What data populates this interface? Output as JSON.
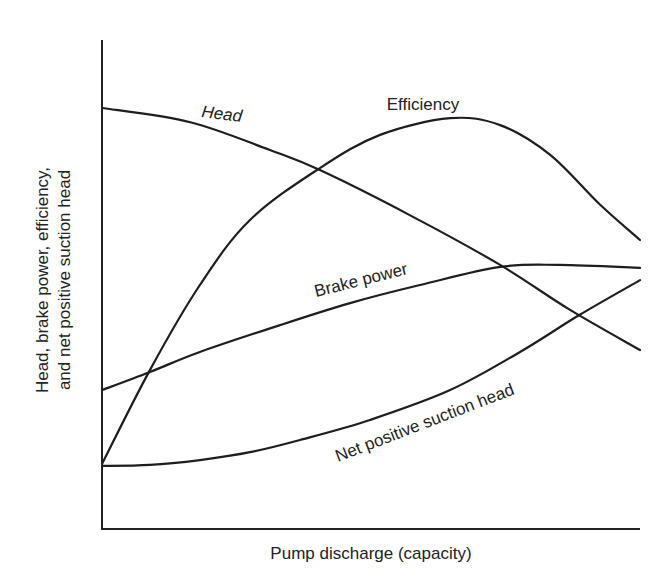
{
  "chart_data": {
    "type": "line",
    "title": "",
    "xlabel": "Pump discharge (capacity)",
    "ylabel_lines": [
      "Head, brake power, efficiency,",
      "and net positive suction head"
    ],
    "xlim": [
      0,
      100
    ],
    "ylim": [
      0,
      100
    ],
    "grid": false,
    "legend": "none (curves labeled inline)",
    "x_ticks": [],
    "y_ticks": [],
    "series": [
      {
        "name": "Head",
        "label": "Head",
        "label_style": "italic",
        "points": [
          [
            0,
            86.1
          ],
          [
            16.4,
            83.2
          ],
          [
            31.2,
            77.5
          ],
          [
            40.5,
            73.4
          ],
          [
            57.2,
            64.2
          ],
          [
            74.0,
            54.0
          ],
          [
            87.0,
            44.8
          ],
          [
            100,
            36.6
          ]
        ]
      },
      {
        "name": "Efficiency",
        "label": "Efficiency",
        "label_style": "normal",
        "points": [
          [
            0,
            13.3
          ],
          [
            8.9,
            32.5
          ],
          [
            18.2,
            49.9
          ],
          [
            27.5,
            63.2
          ],
          [
            40.5,
            73.8
          ],
          [
            51.7,
            80.6
          ],
          [
            64.7,
            84.0
          ],
          [
            74.0,
            82.6
          ],
          [
            83.3,
            76.5
          ],
          [
            92.6,
            66.3
          ],
          [
            100,
            59.1
          ]
        ]
      },
      {
        "name": "Brake power",
        "label": "Brake power",
        "label_style": "normal",
        "points": [
          [
            0,
            28.4
          ],
          [
            8.9,
            32.1
          ],
          [
            18.2,
            36.2
          ],
          [
            33.1,
            41.7
          ],
          [
            46.1,
            46.2
          ],
          [
            59.1,
            49.9
          ],
          [
            74.0,
            53.6
          ],
          [
            85.1,
            54.0
          ],
          [
            100,
            53.4
          ]
        ]
      },
      {
        "name": "Net positive suction head",
        "label": "Net positive suction head",
        "label_style": "normal",
        "points": [
          [
            0,
            12.9
          ],
          [
            8.9,
            13.1
          ],
          [
            18.2,
            14.1
          ],
          [
            27.5,
            15.7
          ],
          [
            36.8,
            18.2
          ],
          [
            49.8,
            22.3
          ],
          [
            64.7,
            28.4
          ],
          [
            77.7,
            36.2
          ],
          [
            88.8,
            43.8
          ],
          [
            100,
            50.9
          ]
        ]
      }
    ]
  }
}
